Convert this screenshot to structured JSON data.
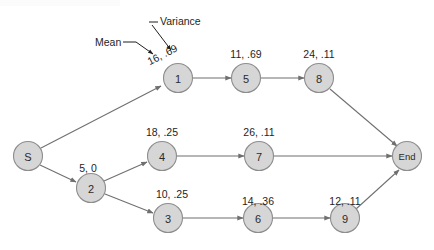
{
  "diagram": {
    "type": "pert-network",
    "title_strip": "",
    "nodes": [
      {
        "id": "S",
        "label": "S",
        "cx": 28,
        "cy": 156
      },
      {
        "id": "1",
        "label": "1",
        "cx": 178,
        "cy": 78
      },
      {
        "id": "5",
        "label": "5",
        "cx": 246,
        "cy": 78
      },
      {
        "id": "8",
        "label": "8",
        "cx": 319,
        "cy": 78
      },
      {
        "id": "2",
        "label": "2",
        "cx": 91,
        "cy": 188
      },
      {
        "id": "4",
        "label": "4",
        "cx": 162,
        "cy": 156
      },
      {
        "id": "7",
        "label": "7",
        "cx": 259,
        "cy": 156
      },
      {
        "id": "3",
        "label": "3",
        "cx": 168,
        "cy": 218
      },
      {
        "id": "6",
        "label": "6",
        "cx": 258,
        "cy": 218
      },
      {
        "id": "9",
        "label": "9",
        "cx": 345,
        "cy": 218
      },
      {
        "id": "End",
        "label": "End",
        "cx": 407,
        "cy": 156
      }
    ],
    "edges": [
      {
        "from": "S",
        "to": "1",
        "label": "16, .69",
        "mean": 16,
        "variance": 0.69,
        "label_rotated": true
      },
      {
        "from": "1",
        "to": "5",
        "label": "11, .69",
        "mean": 11,
        "variance": 0.69
      },
      {
        "from": "5",
        "to": "8",
        "label": "24, .11",
        "mean": 24,
        "variance": 0.11
      },
      {
        "from": "8",
        "to": "End",
        "label": "",
        "mean": null,
        "variance": null
      },
      {
        "from": "S",
        "to": "2",
        "label": "5, 0",
        "mean": 5,
        "variance": 0
      },
      {
        "from": "2",
        "to": "4",
        "label": "18, .25",
        "mean": 18,
        "variance": 0.25
      },
      {
        "from": "4",
        "to": "7",
        "label": "26, .11",
        "mean": 26,
        "variance": 0.11
      },
      {
        "from": "7",
        "to": "End",
        "label": "",
        "mean": null,
        "variance": null
      },
      {
        "from": "2",
        "to": "3",
        "label": "10, .25",
        "mean": 10,
        "variance": 0.25
      },
      {
        "from": "3",
        "to": "6",
        "label": "14, .36",
        "mean": 14,
        "variance": 0.36
      },
      {
        "from": "6",
        "to": "9",
        "label": "12, .11",
        "mean": 12,
        "variance": 0.11
      },
      {
        "from": "9",
        "to": "End",
        "label": "",
        "mean": null,
        "variance": null
      }
    ],
    "annotations": [
      {
        "id": "mean",
        "label": "Mean"
      },
      {
        "id": "variance",
        "label": "Variance"
      }
    ],
    "edge_label_texts": {
      "s_1": "16, .69",
      "n1_5": "11, .69",
      "n5_8": "24, .11",
      "s_2": "5, 0",
      "n2_4": "18, .25",
      "n4_7": "26, .11",
      "n2_3": "10, .25",
      "n3_6": "14, .36",
      "n6_9": "12, .11"
    },
    "rotated_label_parts": {
      "mean_part": "16,",
      "variance_part": ".69"
    },
    "colors": {
      "node_fill": "#d6d6d6",
      "node_stroke": "#8d8d8d",
      "edge": "#6f6f6f",
      "text": "#1e1e1e",
      "background": "#ffffff"
    }
  }
}
